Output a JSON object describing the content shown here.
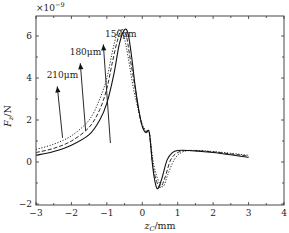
{
  "chart_data": {
    "type": "line",
    "title": "",
    "xlabel": "z_C/mm",
    "ylabel": "F_z/N",
    "y_scale_note": "×10^-9",
    "xlim": [
      -3,
      4
    ],
    "ylim": [
      -2,
      7
    ],
    "xticks": [
      -3,
      -2,
      -1,
      0,
      1,
      2,
      3,
      4
    ],
    "yticks": [
      -2,
      0,
      2,
      4,
      6
    ],
    "grid": false,
    "legend": "inline arrows",
    "series": [
      {
        "name": "150μm",
        "style": "solid",
        "points": [
          [
            -3.0,
            0.32
          ],
          [
            -2.5,
            0.5
          ],
          [
            -2.0,
            0.8
          ],
          [
            -1.5,
            1.3
          ],
          [
            -1.2,
            2.0
          ],
          [
            -1.0,
            2.8
          ],
          [
            -0.8,
            4.2
          ],
          [
            -0.65,
            5.6
          ],
          [
            -0.5,
            6.3
          ],
          [
            -0.4,
            6.1
          ],
          [
            -0.3,
            5.0
          ],
          [
            -0.2,
            3.6
          ],
          [
            -0.1,
            2.5
          ],
          [
            0.0,
            1.7
          ],
          [
            0.1,
            1.4
          ],
          [
            0.18,
            1.5
          ],
          [
            0.22,
            1.1
          ],
          [
            0.3,
            -0.3
          ],
          [
            0.38,
            -1.1
          ],
          [
            0.45,
            -1.25
          ],
          [
            0.55,
            -0.8
          ],
          [
            0.7,
            0.1
          ],
          [
            0.85,
            0.45
          ],
          [
            1.0,
            0.55
          ],
          [
            1.3,
            0.55
          ],
          [
            2.0,
            0.45
          ],
          [
            3.0,
            0.22
          ]
        ]
      },
      {
        "name": "180μm",
        "style": "dashed",
        "points": [
          [
            -3.0,
            0.45
          ],
          [
            -2.5,
            0.65
          ],
          [
            -2.0,
            1.0
          ],
          [
            -1.5,
            1.65
          ],
          [
            -1.2,
            2.5
          ],
          [
            -1.0,
            3.5
          ],
          [
            -0.85,
            4.7
          ],
          [
            -0.7,
            5.8
          ],
          [
            -0.58,
            6.3
          ],
          [
            -0.45,
            6.0
          ],
          [
            -0.35,
            5.0
          ],
          [
            -0.2,
            3.5
          ],
          [
            -0.1,
            2.4
          ],
          [
            0.0,
            1.7
          ],
          [
            0.1,
            1.45
          ],
          [
            0.18,
            1.5
          ],
          [
            0.22,
            1.1
          ],
          [
            0.3,
            -0.2
          ],
          [
            0.42,
            -1.0
          ],
          [
            0.52,
            -1.2
          ],
          [
            0.65,
            -0.7
          ],
          [
            0.8,
            0.1
          ],
          [
            1.0,
            0.45
          ],
          [
            1.3,
            0.55
          ],
          [
            2.0,
            0.48
          ],
          [
            3.0,
            0.28
          ]
        ]
      },
      {
        "name": "210μm",
        "style": "dotted",
        "points": [
          [
            -3.0,
            0.6
          ],
          [
            -2.5,
            0.85
          ],
          [
            -2.0,
            1.25
          ],
          [
            -1.5,
            2.0
          ],
          [
            -1.2,
            3.0
          ],
          [
            -1.0,
            4.0
          ],
          [
            -0.85,
            5.2
          ],
          [
            -0.72,
            6.1
          ],
          [
            -0.64,
            6.3
          ],
          [
            -0.52,
            6.0
          ],
          [
            -0.4,
            5.0
          ],
          [
            -0.25,
            3.5
          ],
          [
            -0.1,
            2.4
          ],
          [
            0.0,
            1.8
          ],
          [
            0.1,
            1.5
          ],
          [
            0.18,
            1.5
          ],
          [
            0.22,
            1.2
          ],
          [
            0.32,
            -0.1
          ],
          [
            0.48,
            -1.0
          ],
          [
            0.6,
            -1.15
          ],
          [
            0.72,
            -0.6
          ],
          [
            0.9,
            0.1
          ],
          [
            1.1,
            0.45
          ],
          [
            1.4,
            0.55
          ],
          [
            2.0,
            0.5
          ],
          [
            3.0,
            0.32
          ]
        ]
      }
    ],
    "annotations": [
      {
        "text": "150μm",
        "arrow_from": [
          -0.9,
          0.9
        ],
        "arrow_to": [
          -1.1,
          5.6
        ],
        "label_at": [
          -1.05,
          5.95
        ]
      },
      {
        "text": "180μm",
        "arrow_from": [
          -1.6,
          1.5
        ],
        "arrow_to": [
          -1.75,
          4.7
        ],
        "label_at": [
          -2.05,
          5.1
        ]
      },
      {
        "text": "210μm",
        "arrow_from": [
          -2.25,
          1.15
        ],
        "arrow_to": [
          -2.4,
          3.6
        ],
        "label_at": [
          -2.7,
          4.0
        ]
      }
    ]
  }
}
